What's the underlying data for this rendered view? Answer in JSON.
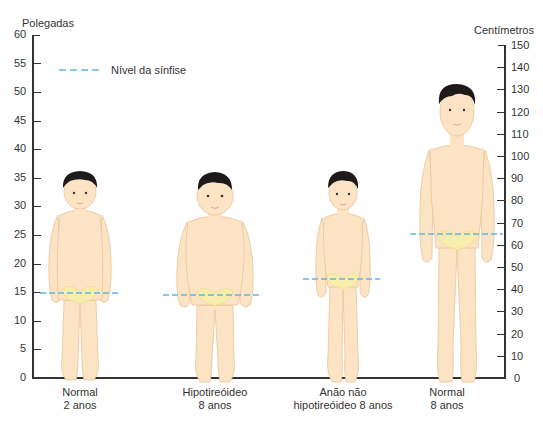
{
  "left_axis": {
    "title": "Polegadas",
    "ticks": [
      "60",
      "55",
      "50",
      "45",
      "40",
      "35",
      "30",
      "25",
      "20",
      "15",
      "10",
      "5",
      "0"
    ]
  },
  "right_axis": {
    "title": "Centímetros",
    "ticks": [
      "150",
      "140",
      "130",
      "120",
      "110",
      "100",
      "90",
      "80",
      "70",
      "60",
      "50",
      "40",
      "30",
      "20",
      "10",
      "0"
    ]
  },
  "legend": {
    "label": "Nível da sínfise",
    "color": "#5fb6e0"
  },
  "figures": [
    {
      "caption_line1": "Normal",
      "caption_line2": "2 anos",
      "height_in": 36,
      "symphysis_in": 14.8
    },
    {
      "caption_line1": "Hipotireóideo",
      "caption_line2": "8 anos",
      "height_in": 36,
      "symphysis_in": 14.5
    },
    {
      "caption_line1": "Anão não",
      "caption_line2": "hipotireóideo 8 anos",
      "height_in": 36,
      "symphysis_in": 17.3
    },
    {
      "caption_line1": "Normal",
      "caption_line2": "8 anos",
      "height_in": 51,
      "symphysis_in": 25
    }
  ],
  "colors": {
    "skin": "#fbe3c4",
    "skin_outline": "#e9c49c",
    "hair": "#1e1a1a",
    "pelvis": "#f7efa8",
    "axis": "#333333"
  }
}
